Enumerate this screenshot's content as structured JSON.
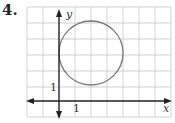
{
  "problem": {
    "number": "4."
  },
  "graph": {
    "x_axis_label": "x",
    "y_axis_label": "y",
    "x_tick_label": "1",
    "y_tick_label": "1",
    "grid_color": "#cfcfcf",
    "axis_color": "#222222",
    "circle_color": "#777777",
    "circle": {
      "center": [
        2,
        3
      ],
      "radius": 2
    }
  }
}
